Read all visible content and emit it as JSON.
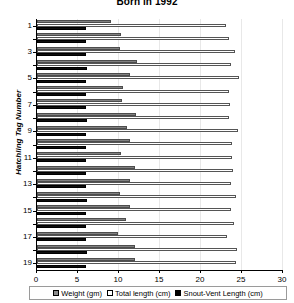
{
  "chart_data": {
    "type": "bar",
    "orientation": "horizontal",
    "title": "Born in 1992",
    "xlabel": "",
    "ylabel": "Hatchling Tag Number",
    "xlim": [
      0,
      30
    ],
    "xticks": [
      0,
      5,
      10,
      15,
      20,
      25,
      30
    ],
    "grid": true,
    "legend_position": "bottom",
    "categories": [
      1,
      2,
      3,
      4,
      5,
      6,
      7,
      8,
      9,
      10,
      11,
      12,
      13,
      14,
      15,
      16,
      17,
      18,
      19
    ],
    "ytick_labels": [
      "1",
      "3",
      "5",
      "7",
      "9",
      "11",
      "13",
      "15",
      "17",
      "19"
    ],
    "series": [
      {
        "name": "Weight (gm)",
        "color": "#808080",
        "values": [
          9.0,
          10.3,
          10.1,
          12.2,
          11.3,
          10.5,
          10.4,
          12.1,
          11.0,
          11.3,
          10.3,
          12.0,
          11.4,
          10.1,
          11.4,
          10.8,
          9.9,
          12.0,
          11.9
        ]
      },
      {
        "name": "Total length (cm)",
        "color": "#ffffff",
        "values": [
          23.1,
          23.4,
          24.2,
          23.6,
          24.6,
          23.4,
          23.5,
          23.4,
          24.5,
          23.8,
          23.8,
          23.9,
          23.7,
          24.3,
          23.6,
          24.0,
          23.2,
          24.4,
          24.3
        ]
      },
      {
        "name": "Snout-Vent Length (cm)",
        "color": "#000000",
        "values": [
          6.0,
          6.0,
          6.0,
          6.1,
          6.0,
          6.0,
          6.0,
          6.1,
          6.0,
          6.0,
          6.0,
          6.0,
          6.0,
          6.1,
          6.0,
          6.0,
          6.0,
          6.1,
          6.0
        ]
      }
    ]
  }
}
